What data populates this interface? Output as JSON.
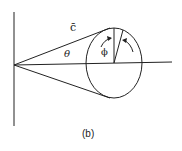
{
  "diagram": {
    "caption": "(b)",
    "labels": {
      "vector": "c̄",
      "theta": "θ",
      "phi": "ϕ"
    },
    "colors": {
      "stroke": "#222222",
      "background": "#ffffff"
    }
  }
}
